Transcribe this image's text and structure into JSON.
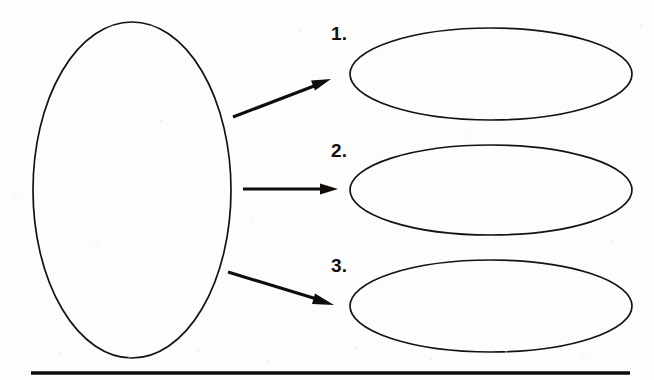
{
  "document": {
    "title": "Concept Map Worksheet",
    "background_color": "#fdfdfd",
    "ink_color": "#110d0b"
  },
  "main_shape": {
    "name": "central-topic-ellipse",
    "label": "",
    "cx": 132,
    "cy": 190,
    "rx": 99,
    "ry": 168
  },
  "branches": [
    {
      "number": "1.",
      "arrow": {
        "x1": 233,
        "y1": 117,
        "x2": 330,
        "y2": 80
      },
      "ellipse": {
        "cx": 491,
        "cy": 74,
        "rx": 141,
        "ry": 46
      },
      "text": ""
    },
    {
      "number": "2.",
      "arrow": {
        "x1": 243,
        "y1": 189,
        "x2": 337,
        "y2": 189
      },
      "ellipse": {
        "cx": 491,
        "cy": 190,
        "rx": 141,
        "ry": 45
      },
      "text": ""
    },
    {
      "number": "3.",
      "arrow": {
        "x1": 228,
        "y1": 272,
        "x2": 333,
        "y2": 304
      },
      "ellipse": {
        "cx": 491,
        "cy": 306,
        "rx": 141,
        "ry": 46
      },
      "text": ""
    }
  ],
  "labels": {
    "one": "1.",
    "two": "2.",
    "three": "3."
  },
  "label_positions": {
    "one": {
      "x": 331,
      "y": 24
    },
    "two": {
      "x": 331,
      "y": 141
    },
    "three": {
      "x": 331,
      "y": 256
    }
  },
  "footer_rule": {
    "name": "bottom-horizontal-rule",
    "x1": 31,
    "x2": 630,
    "y": 373
  }
}
